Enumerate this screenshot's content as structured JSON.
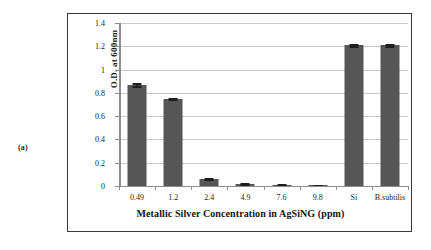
{
  "figure": {
    "panel_label": "(a)"
  },
  "chart_data": {
    "type": "bar",
    "title": "",
    "xlabel": "Metallic Silver Concentration in AgSiNG (ppm)",
    "ylabel": "O.D. at 600nm",
    "categories": [
      "0.49",
      "1.2",
      "2.4",
      "4.9",
      "7.6",
      "9.8",
      "Si",
      "B.subtilis"
    ],
    "values": [
      0.87,
      0.75,
      0.06,
      0.018,
      0.013,
      0.008,
      1.21,
      1.21
    ],
    "errors": [
      0.012,
      0.006,
      0.006,
      0.005,
      0.005,
      0.004,
      0.008,
      0.008
    ],
    "ylim": [
      0,
      1.4
    ],
    "ytick_labels": [
      "0",
      "0.2",
      "0.4",
      "0.6",
      "0.8",
      "1",
      "1.2",
      "1.4"
    ],
    "ytick_values": [
      0,
      0.2,
      0.4,
      0.6,
      0.8,
      1.0,
      1.2,
      1.4
    ],
    "grid": true,
    "legend": "none",
    "series_color": "#565656",
    "gridline_color": "#c9c9c9",
    "axis_color": "#8e8e8e"
  }
}
